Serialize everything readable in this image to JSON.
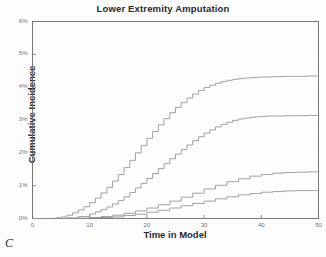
{
  "figure": {
    "panel_label": "C",
    "background_color": "#fefefe",
    "line_color": "#8c8c8c",
    "axis_color": "#6a6a6a",
    "text_color": "#2a2a2a"
  },
  "chart_data": {
    "type": "line",
    "title": "Lower Extremity Amputation",
    "xlabel": "Time in Model",
    "ylabel": "Cumulative Incidence",
    "xlim": [
      0,
      50
    ],
    "ylim": [
      0,
      6
    ],
    "grid": false,
    "legend": "none",
    "xticks": [
      0,
      10,
      20,
      30,
      40,
      50
    ],
    "xtick_labels": [
      "0",
      "10",
      "20",
      "30",
      "40",
      "50"
    ],
    "yticks": [
      0,
      1,
      2,
      3,
      4,
      5,
      6
    ],
    "ytick_labels": [
      "0%",
      "1%",
      "2%",
      "3%",
      "4%",
      "5%",
      "6%"
    ],
    "step_style": "stepped",
    "series": [
      {
        "name": "curve-1",
        "x": [
          0,
          2,
          4,
          5,
          6,
          7,
          8,
          9,
          10,
          11,
          12,
          13,
          14,
          15,
          16,
          17,
          18,
          19,
          20,
          21,
          22,
          23,
          24,
          25,
          26,
          27,
          28,
          29,
          30,
          31,
          32,
          33,
          34,
          35,
          36,
          37,
          38,
          39,
          40,
          42,
          44,
          46,
          48,
          50
        ],
        "values": [
          0,
          0,
          0.02,
          0.05,
          0.1,
          0.17,
          0.26,
          0.36,
          0.48,
          0.62,
          0.78,
          0.95,
          1.14,
          1.34,
          1.55,
          1.77,
          2.0,
          2.22,
          2.44,
          2.65,
          2.85,
          3.04,
          3.22,
          3.38,
          3.53,
          3.67,
          3.79,
          3.9,
          3.99,
          4.06,
          4.12,
          4.17,
          4.21,
          4.24,
          4.26,
          4.28,
          4.29,
          4.3,
          4.31,
          4.32,
          4.33,
          4.33,
          4.34,
          4.34
        ]
      },
      {
        "name": "curve-2",
        "x": [
          0,
          2,
          4,
          6,
          8,
          10,
          11,
          12,
          13,
          14,
          15,
          16,
          17,
          18,
          19,
          20,
          21,
          22,
          23,
          24,
          25,
          26,
          27,
          28,
          29,
          30,
          31,
          32,
          33,
          34,
          35,
          36,
          37,
          38,
          39,
          40,
          41,
          42,
          44,
          46,
          48,
          50
        ],
        "values": [
          0,
          0,
          0.0,
          0.02,
          0.06,
          0.14,
          0.2,
          0.27,
          0.35,
          0.44,
          0.55,
          0.66,
          0.79,
          0.93,
          1.07,
          1.22,
          1.37,
          1.52,
          1.67,
          1.82,
          1.96,
          2.1,
          2.24,
          2.37,
          2.49,
          2.6,
          2.7,
          2.79,
          2.87,
          2.93,
          2.99,
          3.03,
          3.06,
          3.08,
          3.1,
          3.11,
          3.12,
          3.12,
          3.13,
          3.13,
          3.14,
          3.14
        ]
      },
      {
        "name": "curve-3",
        "x": [
          0,
          4,
          8,
          10,
          12,
          14,
          16,
          18,
          20,
          22,
          24,
          26,
          28,
          30,
          32,
          34,
          36,
          38,
          40,
          42,
          44,
          46,
          48,
          50
        ],
        "values": [
          0,
          0,
          0.01,
          0.03,
          0.06,
          0.1,
          0.16,
          0.23,
          0.32,
          0.42,
          0.53,
          0.65,
          0.77,
          0.9,
          1.01,
          1.12,
          1.21,
          1.29,
          1.34,
          1.38,
          1.4,
          1.41,
          1.42,
          1.42
        ]
      },
      {
        "name": "curve-4",
        "x": [
          0,
          4,
          8,
          10,
          12,
          14,
          16,
          18,
          20,
          22,
          24,
          26,
          28,
          30,
          32,
          34,
          36,
          38,
          40,
          42,
          44,
          46,
          48,
          50
        ],
        "values": [
          0,
          0,
          0.0,
          0.01,
          0.03,
          0.05,
          0.09,
          0.13,
          0.19,
          0.25,
          0.32,
          0.39,
          0.46,
          0.53,
          0.6,
          0.66,
          0.72,
          0.76,
          0.8,
          0.82,
          0.84,
          0.85,
          0.85,
          0.86
        ]
      }
    ]
  }
}
